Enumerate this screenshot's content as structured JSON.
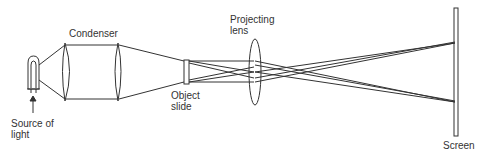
{
  "diagram": {
    "labels": {
      "condenser": "Condenser",
      "projecting_lens_line1": "Projecting",
      "projecting_lens_line2": "lens",
      "object_slide_line1": "Object",
      "object_slide_line2": "slide",
      "source_line1": "Source of",
      "source_line2": "light",
      "screen": "Screen"
    },
    "components": [
      "source-of-light",
      "condenser",
      "object-slide",
      "projecting-lens",
      "screen"
    ],
    "colors": {
      "stroke": "#333333",
      "background": "#ffffff"
    }
  }
}
